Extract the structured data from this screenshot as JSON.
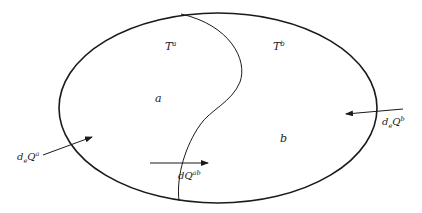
{
  "diagram": {
    "type": "thermodynamic-system",
    "colors": {
      "stroke": "#1a1a1a",
      "background": "#ffffff",
      "text": "#222222"
    },
    "regions": [
      {
        "id": "a",
        "label": "a",
        "temperature": {
          "base": "T",
          "sup": "a"
        }
      },
      {
        "id": "b",
        "label": "b",
        "temperature": {
          "base": "T",
          "sup": "b"
        }
      }
    ],
    "flows": [
      {
        "id": "deQa",
        "d": "d",
        "sub": "e",
        "Q": "Q",
        "sup": "a",
        "direction": "into region a from outside"
      },
      {
        "id": "deQb",
        "d": "d",
        "sub": "e",
        "Q": "Q",
        "sup": "b",
        "direction": "into region b from outside"
      },
      {
        "id": "dQab",
        "d": "d",
        "sub": "",
        "Q": "Q",
        "sup": "ab",
        "direction": "from a to b across boundary"
      }
    ]
  }
}
